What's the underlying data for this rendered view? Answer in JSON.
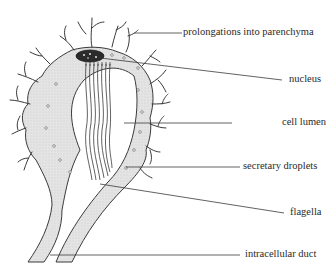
{
  "figure": {
    "labels": [
      {
        "id": "prolongations",
        "text": "prolongations into parenchyma"
      },
      {
        "id": "nucleus",
        "text": "nucleus"
      },
      {
        "id": "cell_lumen",
        "text": "cell lumen"
      },
      {
        "id": "secretary_droplets",
        "text": "secretary droplets"
      },
      {
        "id": "flagella",
        "text": "flagella"
      },
      {
        "id": "intracellular_duct",
        "text": "intracellular duct"
      }
    ],
    "colors": {
      "outline": "#3a3a3a",
      "cytoplasm_fill": "#e6e6e6",
      "nucleus_fill": "#2b2b2b",
      "text": "#2a2a2a"
    }
  }
}
